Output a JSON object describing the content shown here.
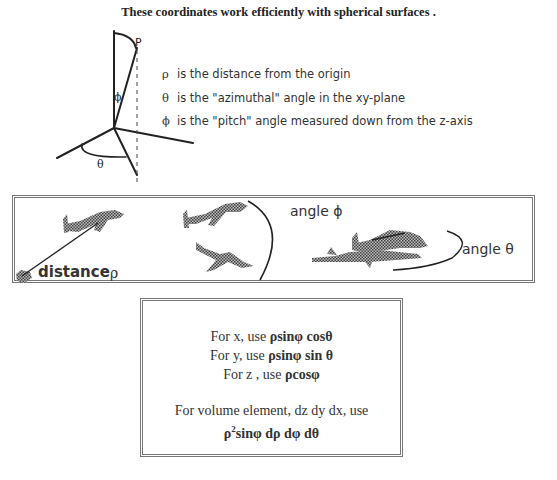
{
  "title": "These coordinates work efficiently with spherical surfaces .",
  "diagram": {
    "point_label": "P",
    "phi_label": "ϕ",
    "theta_label": "θ"
  },
  "definitions": [
    {
      "symbol": "ρ",
      "text": "is the distance from the origin"
    },
    {
      "symbol": "θ",
      "text": "is the \"azimuthal\" angle in the xy-plane"
    },
    {
      "symbol": "ϕ",
      "text": "is the \"pitch\" angle measured down from the z-axis"
    }
  ],
  "illustration": {
    "distance_label": "distance",
    "distance_symbol": "ρ",
    "angle_phi_label": "angle ϕ",
    "angle_theta_label": "angle θ"
  },
  "formulas": {
    "x": {
      "prefix": "For x, use ",
      "expr": "ρsinφ cosθ"
    },
    "y": {
      "prefix": "For y,  use ",
      "expr": "ρsinφ sin θ"
    },
    "z": {
      "prefix": "For z , use ",
      "expr": "ρcosφ"
    },
    "volume_intro": "For volume element, dz dy dx,  use",
    "volume_rho": "ρ",
    "volume_exp": "2",
    "volume_rest": "sinφ dρ dφ dθ"
  }
}
